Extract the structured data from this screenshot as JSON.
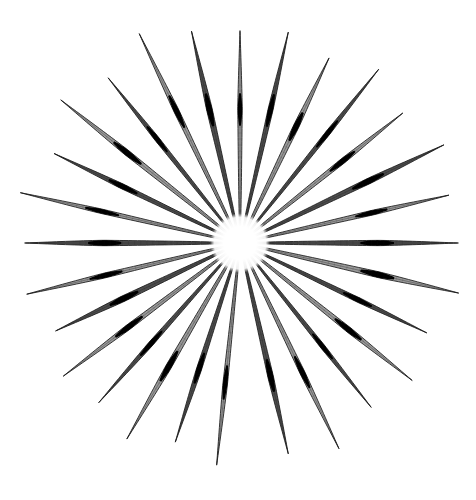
{
  "image": {
    "title": "Radial arrangement of sewing needles",
    "subject": "sewing-needles",
    "width": 476,
    "height": 500,
    "background_color": "#ffffff",
    "description": "Twenty-eight steel sewing needles arranged in a radial starburst / sunburst pattern, points outward, shafts converging on an empty white circular hub at the centre. A gap interrupts the ring at the bottom centre where no needle points straight down."
  },
  "colors": {
    "background": "#ffffff",
    "needle_dark": "#1a1a1a",
    "needle_mid": "#4d4d4d",
    "needle_light": "#9a9a9a",
    "needle_highlight": "#e2e2e2",
    "eye_band": "#000000",
    "hub_fill": "#ffffff"
  },
  "composition": {
    "center_x": 240,
    "center_y": 243,
    "hub_radius": 23,
    "needle_count": 28,
    "angle_step_deg": 12.857,
    "start_angle_deg": -90,
    "gap_at_bottom": true,
    "mean_needle_length": 218,
    "min_needle_length": 196,
    "max_needle_length": 232,
    "needle_max_width": 5.2,
    "eye_band_position_fraction": 0.62,
    "eye_band_length_fraction": 0.1
  },
  "needles": [
    {
      "index": 0,
      "angle_deg": -90.0,
      "length": 212,
      "label": "needle-12-oclock"
    },
    {
      "index": 1,
      "angle_deg": -77.1,
      "length": 216,
      "label": "needle-01"
    },
    {
      "index": 2,
      "angle_deg": -64.3,
      "length": 205,
      "label": "needle-02"
    },
    {
      "index": 3,
      "angle_deg": -51.4,
      "length": 222,
      "label": "needle-03"
    },
    {
      "index": 4,
      "angle_deg": -38.6,
      "length": 208,
      "label": "needle-04"
    },
    {
      "index": 5,
      "angle_deg": -25.7,
      "length": 226,
      "label": "needle-05"
    },
    {
      "index": 6,
      "angle_deg": -12.9,
      "length": 214,
      "label": "needle-06"
    },
    {
      "index": 7,
      "angle_deg": 0.0,
      "length": 218,
      "label": "needle-03-oclock"
    },
    {
      "index": 8,
      "angle_deg": 12.9,
      "length": 224,
      "label": "needle-08"
    },
    {
      "index": 9,
      "angle_deg": 25.7,
      "length": 207,
      "label": "needle-09"
    },
    {
      "index": 10,
      "angle_deg": 38.6,
      "length": 220,
      "label": "needle-10"
    },
    {
      "index": 11,
      "angle_deg": 51.4,
      "length": 210,
      "label": "needle-11"
    },
    {
      "index": 12,
      "angle_deg": 64.3,
      "length": 228,
      "label": "needle-12"
    },
    {
      "index": 13,
      "angle_deg": 77.1,
      "length": 216,
      "label": "needle-13"
    },
    {
      "index": 14,
      "angle_deg": 96.0,
      "length": 223,
      "label": "needle-14"
    },
    {
      "index": 15,
      "angle_deg": 108.0,
      "length": 209,
      "label": "needle-15"
    },
    {
      "index": 16,
      "angle_deg": 120.0,
      "length": 226,
      "label": "needle-16"
    },
    {
      "index": 17,
      "angle_deg": 131.5,
      "length": 213,
      "label": "needle-17"
    },
    {
      "index": 18,
      "angle_deg": 143.0,
      "length": 221,
      "label": "needle-18"
    },
    {
      "index": 19,
      "angle_deg": 154.5,
      "length": 204,
      "label": "needle-19"
    },
    {
      "index": 20,
      "angle_deg": 166.5,
      "length": 219,
      "label": "needle-20"
    },
    {
      "index": 21,
      "angle_deg": 180.0,
      "length": 215,
      "label": "needle-09-oclock"
    },
    {
      "index": 22,
      "angle_deg": 192.9,
      "length": 225,
      "label": "needle-22"
    },
    {
      "index": 23,
      "angle_deg": 205.7,
      "length": 206,
      "label": "needle-23"
    },
    {
      "index": 24,
      "angle_deg": 218.6,
      "length": 229,
      "label": "needle-24"
    },
    {
      "index": 25,
      "angle_deg": 231.4,
      "length": 211,
      "label": "needle-25"
    },
    {
      "index": 26,
      "angle_deg": 244.3,
      "length": 232,
      "label": "needle-26"
    },
    {
      "index": 27,
      "angle_deg": 257.1,
      "length": 217,
      "label": "needle-27"
    }
  ]
}
